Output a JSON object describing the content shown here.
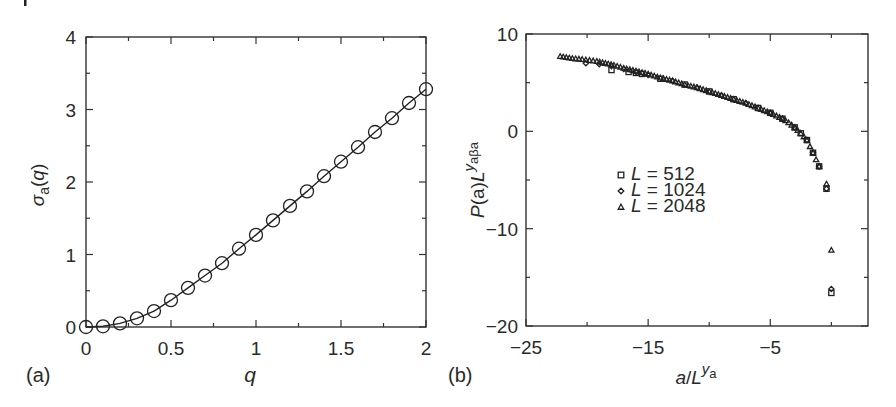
{
  "figure": {
    "crop_mark": true
  },
  "chart_data": [
    {
      "panel": "(a)",
      "type": "line",
      "title": "",
      "xlabel": "q",
      "ylabel": "σ_a(q)",
      "xlim": [
        0,
        2
      ],
      "ylim": [
        0,
        4
      ],
      "xticks": [
        0,
        0.5,
        1,
        1.5,
        2
      ],
      "xtick_labels": [
        "0",
        "0.5",
        "1",
        "1.5",
        "2"
      ],
      "x_minor_ticks": [
        0.25,
        0.75,
        1.25,
        1.75
      ],
      "yticks": [
        0,
        1,
        2,
        3,
        4
      ],
      "ytick_labels": [
        "0",
        "1",
        "2",
        "3",
        "4"
      ],
      "y_minor_ticks": [
        0.5,
        1.5,
        2.5,
        3.5
      ],
      "grid": false,
      "legend": null,
      "series": [
        {
          "name": "σ_a(q)",
          "marker": "open-circle",
          "line": "solid",
          "x": [
            0.0,
            0.1,
            0.2,
            0.3,
            0.4,
            0.5,
            0.6,
            0.7,
            0.8,
            0.9,
            1.0,
            1.1,
            1.2,
            1.3,
            1.4,
            1.5,
            1.6,
            1.7,
            1.8,
            1.9,
            2.0
          ],
          "y": [
            0.0,
            0.01,
            0.05,
            0.12,
            0.22,
            0.37,
            0.54,
            0.71,
            0.88,
            1.08,
            1.27,
            1.47,
            1.67,
            1.87,
            2.08,
            2.28,
            2.48,
            2.69,
            2.88,
            3.09,
            3.28
          ]
        }
      ]
    },
    {
      "panel": "(b)",
      "type": "scatter",
      "title": "",
      "xlabel": "a/L^{y_a}",
      "ylabel": "P(a)L^{y_a β_a}",
      "xlim": [
        -25,
        3
      ],
      "ylim": [
        -20,
        10
      ],
      "xticks": [
        -25,
        -15,
        -5
      ],
      "xtick_labels": [
        "−25",
        "−15",
        "−5"
      ],
      "x_minor_ticks": [
        -20,
        -10,
        0
      ],
      "yticks": [
        10,
        0,
        -10,
        -20
      ],
      "ytick_labels": [
        "10",
        "0",
        "−10",
        "−20"
      ],
      "y_minor_ticks": [
        5,
        -5,
        -15
      ],
      "grid": false,
      "legend": {
        "position": "center-left inside",
        "entries": [
          {
            "marker": "open-square",
            "label": "L = 512",
            "L": "L",
            "eq": " = 512"
          },
          {
            "marker": "open-diamond",
            "label": "L = 1024",
            "L": "L",
            "eq": " = 1024"
          },
          {
            "marker": "open-triangle",
            "label": "L = 2048",
            "L": "L",
            "eq": " = 2048"
          }
        ]
      },
      "series": [
        {
          "name": "L = 512",
          "marker": "open-square",
          "x": [
            -18.0,
            -16.6,
            -16.0,
            -15.5,
            -14.0,
            -12.0,
            -10.0,
            -8.0,
            -6.0,
            -5.0,
            -4.0,
            -3.0,
            -2.5,
            -2.0,
            -1.5,
            -1.0,
            -0.4,
            0.0
          ],
          "y": [
            6.3,
            6.1,
            6.0,
            5.9,
            5.4,
            4.8,
            4.1,
            3.3,
            2.4,
            1.9,
            1.3,
            0.4,
            -0.2,
            -0.9,
            -2.2,
            -3.6,
            -5.9,
            -16.6
          ]
        },
        {
          "name": "L = 1024",
          "marker": "open-diamond",
          "x": [
            -20.1,
            -19.0,
            -18.0,
            -17.0,
            -16.0,
            -15.0,
            -13.0,
            -11.0,
            -9.0,
            -7.0,
            -5.0,
            -4.0,
            -3.0,
            -2.0,
            -1.5,
            -1.0,
            -0.4,
            0.0
          ],
          "y": [
            7.0,
            6.9,
            6.7,
            6.4,
            6.1,
            5.8,
            5.2,
            4.5,
            3.7,
            2.9,
            1.9,
            1.3,
            0.4,
            -0.9,
            -2.2,
            -3.6,
            -5.9,
            -16.2
          ]
        },
        {
          "name": "L = 2048",
          "marker": "open-triangle",
          "x": [
            -22.2,
            -21.2,
            -20.4,
            -19.8,
            -19.2,
            -18.5,
            -17.8,
            -17.0,
            -16.0,
            -15.0,
            -14.0,
            -13.0,
            -12.0,
            -11.0,
            -10.0,
            -9.0,
            -8.0,
            -7.0,
            -6.0,
            -5.0,
            -4.5,
            -4.0,
            -3.5,
            -3.0,
            -2.5,
            -2.0,
            -1.5,
            -1.0,
            -0.4,
            0.0
          ],
          "y": [
            7.7,
            7.5,
            7.4,
            7.3,
            7.2,
            7.0,
            6.8,
            6.5,
            6.2,
            5.9,
            5.5,
            5.2,
            4.8,
            4.5,
            4.1,
            3.7,
            3.3,
            2.9,
            2.4,
            1.9,
            1.6,
            1.3,
            0.9,
            0.4,
            -0.2,
            -0.9,
            -2.2,
            -3.6,
            -5.4,
            -12.2
          ]
        }
      ]
    }
  ]
}
